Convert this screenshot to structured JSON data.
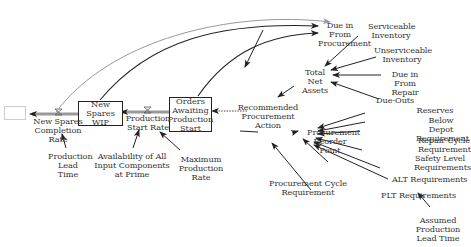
{
  "diagram": {
    "type": "stock-and-flow",
    "stocks": {
      "new_spares_wip": "New Spares WIP",
      "orders_awaiting": "Orders Awaiting Production Start"
    },
    "flows": {
      "completion_rate": "New Spares Completion Rate",
      "start_rate": "Production Start Rate"
    },
    "variables": {
      "production_lead_time": "Production Lead Time",
      "availability": "Availability of All Input Components at Prime",
      "max_production_rate": "Maximum Production Rate",
      "recommended_procurement_action": "Recommended Procurement Action",
      "due_in_from_procurement": "Due in From Procurement",
      "serviceable_inventory": "Serviceable Inventory",
      "unserviceable_inventory": "Unserviceable Inventory",
      "total_net_assets": "Total Net Assets",
      "due_in_from_repair": "Due in From Repair",
      "due_outs": "Due-Outs",
      "procurement_reorder_point": "Procurement Reorder Point",
      "reserves": "Reserves",
      "below_depot_requirement": "Below Depot Requirement",
      "repair_cycle_requirements": "Repair Cycle Requirements",
      "safety_level_requirements": "Safety Level Requirements",
      "alt_requirements": "ALT Requirements",
      "plt_requirements": "PLT Requirements",
      "procurement_cycle_requirement": "Procurement Cycle Requirement",
      "assumed_production_lead_time": "Assumed Production Lead Time"
    },
    "colors": {
      "line": "#222222",
      "pipe": "#888888",
      "gray_link": "#999999"
    }
  }
}
